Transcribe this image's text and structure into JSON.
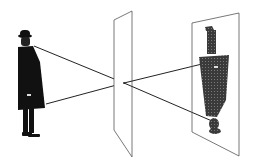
{
  "diagram": {
    "type": "pinhole-camera-projection",
    "elements": [
      {
        "id": "observer",
        "label": "man in hat and overcoat (upright subject)"
      },
      {
        "id": "pinhole-plane",
        "label": "aperture plane with pinhole"
      },
      {
        "id": "image-plane",
        "label": "screen with inverted projected image"
      },
      {
        "id": "ray-top",
        "label": "ray from head through pinhole to bottom of image"
      },
      {
        "id": "ray-bottom",
        "label": "ray from coat hem through pinhole to top of image"
      }
    ],
    "colors": {
      "background": "#ffffff",
      "figure": "#111111",
      "projection": "#3a3a3a",
      "plane_stroke": "#555555",
      "ray": "#222222"
    }
  }
}
